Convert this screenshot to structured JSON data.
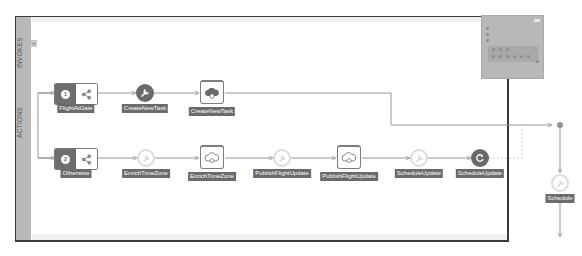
{
  "rail": {
    "invokes_label": "INVOKES",
    "actions_label": "ACTIONS",
    "toggle_glyph": "«"
  },
  "flow": {
    "top_branch": {
      "router": {
        "badge": "1",
        "label": "FlightAtGate",
        "icon": "share-icon"
      },
      "nodes": [
        {
          "type": "map-action",
          "label": "CreateNewTask",
          "icon": "wrench-icon",
          "style": "dark"
        },
        {
          "type": "invoke",
          "label": "CreateNewTask",
          "icon": "cloud-icon",
          "style": "filled"
        }
      ]
    },
    "bottom_branch": {
      "router": {
        "badge": "2",
        "label": "Otherwise",
        "icon": "share-icon"
      },
      "nodes": [
        {
          "type": "map-action",
          "label": "EnrichTimeZone",
          "icon": "wrench-icon",
          "style": "light"
        },
        {
          "type": "invoke",
          "label": "EnrichTimeZone",
          "icon": "cloud-icon",
          "style": "outline"
        },
        {
          "type": "map-action",
          "label": "PublishFlightUpdate",
          "icon": "wrench-icon",
          "style": "light"
        },
        {
          "type": "invoke",
          "label": "PublishFlightUpdate",
          "icon": "cloud-icon",
          "style": "outline"
        },
        {
          "type": "map-action",
          "label": "ScheduleUpdate",
          "icon": "wrench-icon",
          "style": "light"
        },
        {
          "type": "schedule",
          "label": "ScheduleUpdate",
          "icon": "refresh-icon",
          "style": "dark"
        }
      ]
    },
    "merged_node": {
      "label": "Schedule",
      "icon": "wrench-icon",
      "style": "light"
    }
  },
  "colors": {
    "frame_border": "#3a3a3a",
    "rail": "#b9b9b9",
    "node_dark": "#6a6a6a",
    "label_bg": "#6b6b6b",
    "edge": "#8a8a8a"
  }
}
